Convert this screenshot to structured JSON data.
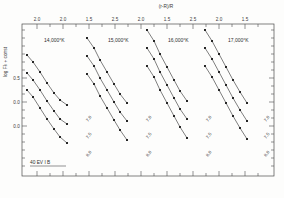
{
  "figure": {
    "top_axis_label": "(r-R)/R",
    "left_axis_label": "log Fλ + const",
    "corner_note": "40 EV I B",
    "frame": {
      "x": 22,
      "y": 24,
      "w": 252,
      "h": 152
    }
  },
  "panels": [
    {
      "label": "14,000°K",
      "lx": 44,
      "ly": 42
    },
    {
      "label": "15,000°K",
      "lx": 108,
      "ly": 42
    },
    {
      "label": "16,000°K",
      "lx": 168,
      "ly": 42
    },
    {
      "label": "17,000°K",
      "lx": 228,
      "ly": 42
    }
  ],
  "top_ticks": [
    {
      "x": 37,
      "label": "2.0",
      "major": true
    },
    {
      "x": 50,
      "label": "",
      "major": false
    },
    {
      "x": 63,
      "label": "2.0",
      "major": true
    },
    {
      "x": 76,
      "label": "",
      "major": false
    },
    {
      "x": 89,
      "label": "1.5",
      "major": true
    },
    {
      "x": 102,
      "label": "",
      "major": false
    },
    {
      "x": 115,
      "label": "2.5",
      "major": true
    },
    {
      "x": 128,
      "label": "",
      "major": false
    },
    {
      "x": 141,
      "label": "2.0",
      "major": true
    },
    {
      "x": 154,
      "label": "",
      "major": false
    },
    {
      "x": 167,
      "label": "1.5",
      "major": true
    },
    {
      "x": 180,
      "label": "",
      "major": false
    },
    {
      "x": 193,
      "label": "2.5",
      "major": true
    },
    {
      "x": 206,
      "label": "",
      "major": false
    },
    {
      "x": 219,
      "label": "2.0",
      "major": true
    },
    {
      "x": 232,
      "label": "",
      "major": false
    },
    {
      "x": 245,
      "label": "1.5",
      "major": true
    },
    {
      "x": 258,
      "label": "",
      "major": false
    }
  ],
  "left_ticks": [
    {
      "y": 30,
      "label": ""
    },
    {
      "y": 38,
      "label": ""
    },
    {
      "y": 46,
      "label": ""
    },
    {
      "y": 54,
      "label": ""
    },
    {
      "y": 62,
      "label": ""
    },
    {
      "y": 70,
      "label": ""
    },
    {
      "y": 78,
      "label": "0.5"
    },
    {
      "y": 86,
      "label": ""
    },
    {
      "y": 94,
      "label": ""
    },
    {
      "y": 102,
      "label": "0.0"
    },
    {
      "y": 110,
      "label": ""
    },
    {
      "y": 118,
      "label": ""
    },
    {
      "y": 126,
      "label": "0.0"
    },
    {
      "y": 134,
      "label": ""
    },
    {
      "y": 142,
      "label": ""
    },
    {
      "y": 150,
      "label": ""
    },
    {
      "y": 158,
      "label": ""
    },
    {
      "y": 166,
      "label": ""
    }
  ],
  "chart_data": {
    "type": "scatter",
    "title": "",
    "xlabel": "(r-R)/R",
    "ylabel": "log Fλ + const",
    "grid": false,
    "legend": "in-panel labels",
    "panels": [
      {
        "temperature": "14,000°K",
        "series": [
          {
            "name": "7.0",
            "label_pos": [
              88,
              122
            ],
            "points": [
              [
                27,
                55
              ],
              [
                33,
                62
              ],
              [
                40,
                72
              ],
              [
                47,
                83
              ],
              [
                54,
                93
              ],
              [
                60,
                100
              ],
              [
                67,
                105
              ]
            ]
          },
          {
            "name": "7.5",
            "label_pos": [
              88,
              139
            ],
            "points": [
              [
                27,
                73
              ],
              [
                33,
                80
              ],
              [
                40,
                90
              ],
              [
                47,
                101
              ],
              [
                54,
                111
              ],
              [
                60,
                119
              ],
              [
                67,
                124
              ]
            ]
          },
          {
            "name": "8.0",
            "label_pos": [
              88,
              157
            ],
            "points": [
              [
                27,
                90
              ],
              [
                33,
                97
              ],
              [
                40,
                108
              ],
              [
                47,
                119
              ],
              [
                54,
                129
              ],
              [
                60,
                137
              ],
              [
                67,
                143
              ]
            ]
          }
        ]
      },
      {
        "temperature": "15,000°K",
        "series": [
          {
            "name": "7.0",
            "label_pos": [
              148,
              122
            ],
            "points": [
              [
                87,
                38
              ],
              [
                94,
                48
              ],
              [
                100,
                60
              ],
              [
                107,
                72
              ],
              [
                114,
                84
              ],
              [
                120,
                94
              ],
              [
                127,
                103
              ]
            ]
          },
          {
            "name": "7.5",
            "label_pos": [
              148,
              139
            ],
            "points": [
              [
                87,
                56
              ],
              [
                94,
                66
              ],
              [
                100,
                78
              ],
              [
                107,
                90
              ],
              [
                114,
                102
              ],
              [
                120,
                112
              ],
              [
                127,
                121
              ]
            ]
          },
          {
            "name": "8.0",
            "label_pos": [
              148,
              157
            ],
            "points": [
              [
                87,
                74
              ],
              [
                94,
                84
              ],
              [
                100,
                96
              ],
              [
                107,
                108
              ],
              [
                114,
                120
              ],
              [
                120,
                130
              ],
              [
                127,
                140
              ]
            ]
          }
        ]
      },
      {
        "temperature": "16,000°K",
        "series": [
          {
            "name": "7.0",
            "label_pos": [
              208,
              122
            ],
            "points": [
              [
                147,
                30
              ],
              [
                154,
                41
              ],
              [
                160,
                54
              ],
              [
                167,
                67
              ],
              [
                174,
                80
              ],
              [
                180,
                91
              ],
              [
                187,
                101
              ]
            ]
          },
          {
            "name": "7.5",
            "label_pos": [
              208,
              139
            ],
            "points": [
              [
                147,
                48
              ],
              [
                154,
                59
              ],
              [
                160,
                72
              ],
              [
                167,
                85
              ],
              [
                174,
                98
              ],
              [
                180,
                109
              ],
              [
                187,
                119
              ]
            ]
          },
          {
            "name": "8.0",
            "label_pos": [
              208,
              157
            ],
            "points": [
              [
                147,
                66
              ],
              [
                154,
                77
              ],
              [
                160,
                90
              ],
              [
                167,
                103
              ],
              [
                174,
                116
              ],
              [
                180,
                127
              ],
              [
                187,
                138
              ]
            ]
          }
        ]
      },
      {
        "temperature": "17,000°K",
        "series": [
          {
            "name": "7.0",
            "label_pos": [
              266,
              122
            ],
            "points": [
              [
                205,
                30
              ],
              [
                212,
                41
              ],
              [
                219,
                54
              ],
              [
                226,
                67
              ],
              [
                233,
                80
              ],
              [
                240,
                92
              ],
              [
                247,
                103
              ]
            ]
          },
          {
            "name": "7.5",
            "label_pos": [
              266,
              139
            ],
            "points": [
              [
                205,
                48
              ],
              [
                212,
                59
              ],
              [
                219,
                72
              ],
              [
                226,
                85
              ],
              [
                233,
                98
              ],
              [
                240,
                110
              ],
              [
                247,
                121
              ]
            ]
          },
          {
            "name": "8.0",
            "label_pos": [
              266,
              157
            ],
            "points": [
              [
                205,
                66
              ],
              [
                212,
                77
              ],
              [
                219,
                90
              ],
              [
                226,
                103
              ],
              [
                233,
                116
              ],
              [
                240,
                128
              ],
              [
                247,
                139
              ]
            ]
          }
        ]
      }
    ]
  }
}
